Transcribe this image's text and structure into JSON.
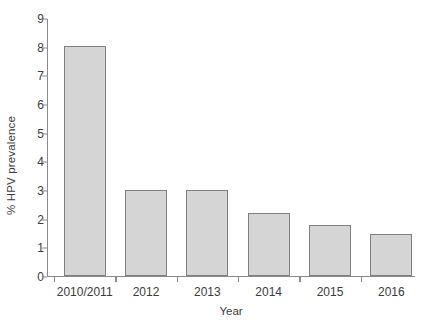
{
  "chart_data": {
    "type": "bar",
    "title": "",
    "subtitle": "",
    "xlabel": "Year",
    "ylabel": "% HPV prevalence",
    "categories": [
      "2010/2011",
      "2012",
      "2013",
      "2014",
      "2015",
      "2016"
    ],
    "values": [
      8.0,
      3.0,
      3.0,
      2.17,
      1.77,
      1.45
    ],
    "series": [
      {
        "name": "% HPV prevalence",
        "values": [
          8.0,
          3.0,
          3.0,
          2.17,
          1.77,
          1.45
        ]
      }
    ],
    "ylim": [
      0,
      9
    ],
    "ytick_labels": [
      "0",
      "1",
      "2",
      "3",
      "4",
      "5",
      "6",
      "7",
      "8",
      "9"
    ],
    "ytick_values": [
      0,
      1,
      2,
      3,
      4,
      5,
      6,
      7,
      8,
      9
    ],
    "grid": false,
    "legend": false,
    "legend_position": "none",
    "annotations": [],
    "bar_fill_color": "#d5d5d5",
    "bar_border_color": "#808080",
    "axis_color": "#8a8a8a",
    "text_color": "#3b3b3b",
    "background_color": "#ffffff"
  }
}
